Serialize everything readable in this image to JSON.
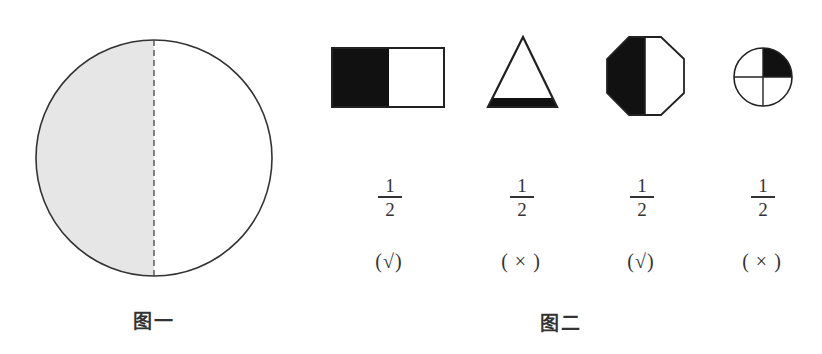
{
  "figure1": {
    "caption": "图一",
    "shape": "circle",
    "shaded_part": "left half",
    "divider": "dashed vertical line"
  },
  "figure2": {
    "caption": "图二",
    "items": [
      {
        "shape": "rectangle",
        "shaded": "left half",
        "fraction_num": "1",
        "fraction_den": "2",
        "judgement": "(√)"
      },
      {
        "shape": "triangle",
        "shaded": "bottom strip",
        "fraction_num": "1",
        "fraction_den": "2",
        "judgement": "( × )"
      },
      {
        "shape": "octagon",
        "shaded": "left half",
        "fraction_num": "1",
        "fraction_den": "2",
        "judgement": "(√)"
      },
      {
        "shape": "circle-quartered",
        "shaded": "top-right quarter",
        "fraction_num": "1",
        "fraction_den": "2",
        "judgement": "( × )"
      }
    ]
  },
  "colors": {
    "shade_gray": "#e6e6e6",
    "shade_black": "#111111",
    "stroke": "#333333"
  }
}
